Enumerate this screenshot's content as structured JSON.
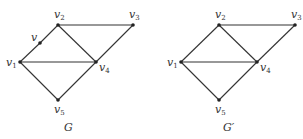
{
  "graphs": [
    {
      "caption": "G",
      "vertices": [
        {
          "id": "v1",
          "name": "v",
          "sub": "1",
          "x": 20,
          "y": 62,
          "lx": 6,
          "ly": 66
        },
        {
          "id": "v2",
          "name": "v",
          "sub": "2",
          "x": 58,
          "y": 25,
          "lx": 54,
          "ly": 18
        },
        {
          "id": "v3",
          "name": "v",
          "sub": "3",
          "x": 133,
          "y": 25,
          "lx": 129,
          "ly": 18
        },
        {
          "id": "v4",
          "name": "v",
          "sub": "4",
          "x": 96,
          "y": 62,
          "lx": 99,
          "ly": 71
        },
        {
          "id": "v5",
          "name": "v",
          "sub": "5",
          "x": 58,
          "y": 100,
          "lx": 54,
          "ly": 113
        },
        {
          "id": "v",
          "name": "v",
          "sub": "",
          "x": 40,
          "y": 43,
          "lx": 31,
          "ly": 41
        }
      ],
      "edges": [
        [
          "v1",
          "v"
        ],
        [
          "v",
          "v2"
        ],
        [
          "v2",
          "v3"
        ],
        [
          "v2",
          "v4"
        ],
        [
          "v3",
          "v4"
        ],
        [
          "v1",
          "v4"
        ],
        [
          "v1",
          "v5"
        ],
        [
          "v5",
          "v4"
        ]
      ],
      "caption_pos": {
        "x": 64,
        "y": 131
      }
    },
    {
      "caption": "G′",
      "vertices": [
        {
          "id": "v1",
          "name": "v",
          "sub": "1",
          "x": 181,
          "y": 62,
          "lx": 167,
          "ly": 66
        },
        {
          "id": "v2",
          "name": "v",
          "sub": "2",
          "x": 219,
          "y": 25,
          "lx": 215,
          "ly": 18
        },
        {
          "id": "v3",
          "name": "v",
          "sub": "3",
          "x": 295,
          "y": 25,
          "lx": 291,
          "ly": 18
        },
        {
          "id": "v4",
          "name": "v",
          "sub": "4",
          "x": 257,
          "y": 62,
          "lx": 260,
          "ly": 71
        },
        {
          "id": "v5",
          "name": "v",
          "sub": "5",
          "x": 219,
          "y": 100,
          "lx": 215,
          "ly": 113
        }
      ],
      "edges": [
        [
          "v1",
          "v2"
        ],
        [
          "v2",
          "v3"
        ],
        [
          "v2",
          "v4"
        ],
        [
          "v3",
          "v4"
        ],
        [
          "v1",
          "v4"
        ],
        [
          "v1",
          "v5"
        ],
        [
          "v5",
          "v4"
        ]
      ],
      "caption_pos": {
        "x": 223,
        "y": 131
      }
    }
  ]
}
